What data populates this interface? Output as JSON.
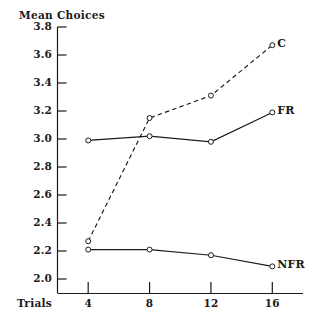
{
  "figure": {
    "background_color": "#ffffff",
    "ink_color": "#1a1a1a"
  },
  "chart_data": {
    "type": "line",
    "title": "",
    "subtitle": "",
    "xlabel": "Trials",
    "ylabel": "Mean Choices",
    "categories": [
      "4",
      "8",
      "12",
      "16"
    ],
    "x": [
      4,
      8,
      12,
      16
    ],
    "xlim": [
      2,
      18
    ],
    "ylim": [
      1.9,
      3.8
    ],
    "yticks": [
      "3.8",
      "3.6",
      "3.4",
      "3.2",
      "3.0",
      "2.8",
      "2.6",
      "2.4",
      "2.2",
      "2.0"
    ],
    "ytick_values": [
      3.8,
      3.6,
      3.4,
      3.2,
      3.0,
      2.8,
      2.6,
      2.4,
      2.2,
      2.0
    ],
    "xticks": [
      "4",
      "8",
      "12",
      "16"
    ],
    "grid": false,
    "legend_position": "right-of-line-ends",
    "marker": "open-circle",
    "series": [
      {
        "name": "C",
        "label": "C",
        "linestyle": "dashed",
        "color": "#1a1a1a",
        "values": [
          2.27,
          3.15,
          3.31,
          3.67
        ]
      },
      {
        "name": "FR",
        "label": "FR",
        "linestyle": "solid",
        "color": "#1a1a1a",
        "values": [
          2.99,
          3.02,
          2.98,
          3.19
        ]
      },
      {
        "name": "NFR",
        "label": "NFR",
        "linestyle": "solid",
        "color": "#1a1a1a",
        "values": [
          2.21,
          2.21,
          2.17,
          2.09
        ]
      }
    ]
  }
}
